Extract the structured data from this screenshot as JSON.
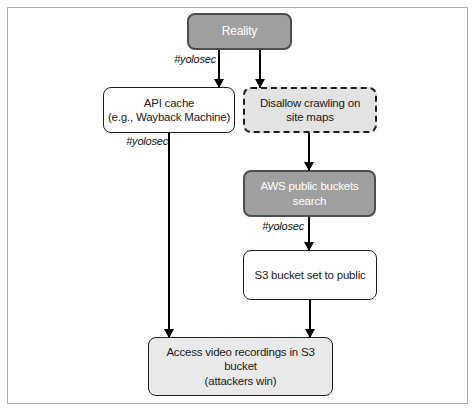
{
  "colors": {
    "canvas_bg": "#ffffff",
    "frame_border": "#b0b0b0",
    "gray_node_fill": "#9f9f9f",
    "gray_node_border": "#4d4d4d",
    "gray_node_text": "#ffffff",
    "light_node_fill": "#e3e3e3",
    "lighter_node_fill": "#e9e9e9",
    "white_node_fill": "#ffffff",
    "dark_border": "#1f1f1f",
    "arrow_color": "#000000",
    "text_color": "#1a1a1a"
  },
  "nodes": {
    "reality": {
      "label": "Reality"
    },
    "api_cache": {
      "line1": "API cache",
      "line2": "(e.g., Wayback Machine)"
    },
    "disallow_crawling": {
      "line1": "Disallow crawling on",
      "line2": "site maps"
    },
    "aws_buckets": {
      "line1": "AWS public buckets",
      "line2": "search"
    },
    "s3_public": {
      "label": "S3 bucket set to public"
    },
    "access_recordings": {
      "line1": "Access video recordings in S3 bucket",
      "line2": "(attackers win)"
    }
  },
  "edge_labels": {
    "reality_to_api": "#yolosec",
    "api_to_access": "#yolosec",
    "aws_to_s3": "#yolosec"
  }
}
